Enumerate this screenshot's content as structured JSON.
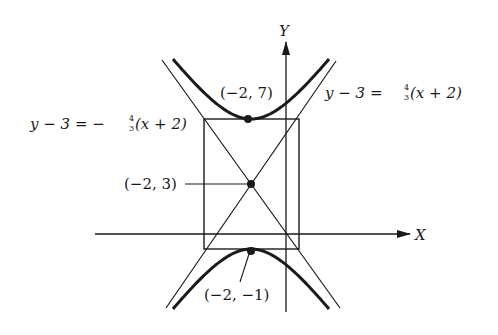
{
  "figure": {
    "type": "hyperbola-diagram",
    "axes": {
      "x_label": "X",
      "y_label": "Y"
    },
    "center": {
      "label": "(−2, 3)",
      "x": -2,
      "y": 3
    },
    "vertices": [
      {
        "label": "(−2, 7)",
        "x": -2,
        "y": 7
      },
      {
        "label": "(−2, −1)",
        "x": -2,
        "y": -1
      }
    ],
    "asymptotes": [
      {
        "label_lhs": "y − 3 = ",
        "label_num": "4",
        "label_den": "3",
        "label_rhs": "(x + 2)",
        "slope_sign": "+"
      },
      {
        "label_lhs": "y − 3 = − ",
        "label_num": "4",
        "label_den": "3",
        "label_rhs": "(x + 2)",
        "slope_sign": "−"
      }
    ],
    "colors": {
      "ink": "#1a1a1a",
      "background": "#ffffff"
    }
  }
}
